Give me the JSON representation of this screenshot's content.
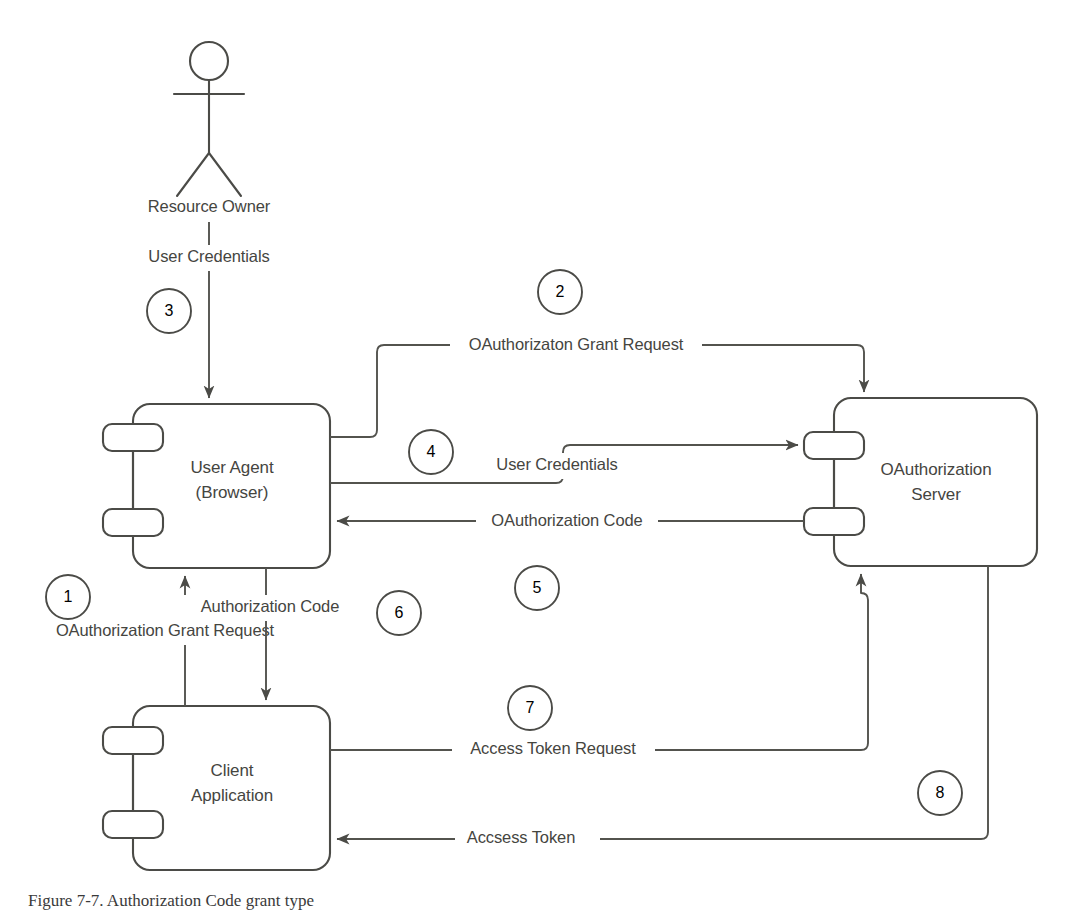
{
  "figure": {
    "caption": "Figure 7-7. Authorization Code grant type",
    "type": "uml-component-diagram"
  },
  "actors": [
    {
      "id": "resource-owner",
      "label": "Resource Owner",
      "shape": "stick-figure"
    }
  ],
  "components": [
    {
      "id": "user-agent",
      "line1": "User Agent",
      "line2": "(Browser)",
      "ports": 2
    },
    {
      "id": "oauth-server",
      "line1": "OAuthorization",
      "line2": "Server",
      "ports": 2
    },
    {
      "id": "client-app",
      "line1": "Client",
      "line2": "Application",
      "ports": 2
    }
  ],
  "flows": [
    {
      "step": "1",
      "label": "OAuthorization Grant Request",
      "from": "client-app",
      "to": "user-agent",
      "direction": "up"
    },
    {
      "step": "2",
      "label": "OAuthorizaton Grant Request",
      "from": "user-agent",
      "to": "oauth-server",
      "direction": "right"
    },
    {
      "step": "3",
      "label": "User Credentials",
      "from": "resource-owner",
      "to": "user-agent",
      "direction": "down"
    },
    {
      "step": "4",
      "label": "User Credentials",
      "from": "user-agent",
      "to": "oauth-server",
      "direction": "right"
    },
    {
      "step": "5",
      "label": "OAuthorization Code",
      "from": "oauth-server",
      "to": "user-agent",
      "direction": "left"
    },
    {
      "step": "6",
      "label": "Authorization Code",
      "from": "user-agent",
      "to": "client-app",
      "direction": "down"
    },
    {
      "step": "7",
      "label": "Access Token Request",
      "from": "client-app",
      "to": "oauth-server",
      "direction": "right"
    },
    {
      "step": "8",
      "label": "Accsess Token",
      "from": "oauth-server",
      "to": "client-app",
      "direction": "left"
    }
  ],
  "step_markers": [
    "1",
    "2",
    "3",
    "4",
    "5",
    "6",
    "7",
    "8"
  ],
  "colors": {
    "stroke": "#4b4b47",
    "text": "#45453f",
    "background": "#ffffff"
  }
}
